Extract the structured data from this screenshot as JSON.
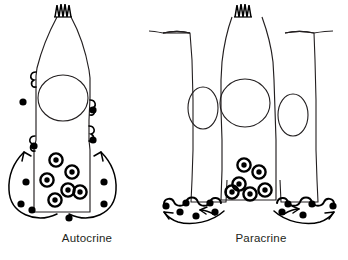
{
  "figure": {
    "background_color": "#ffffff",
    "ink_color": "#000000",
    "outline_color": "#231f20",
    "caption_color": "#231f20",
    "width": 348,
    "height": 260,
    "type": "line-art-diagram"
  },
  "panels": [
    {
      "id": "autocrine",
      "caption": "Autocrine",
      "cell_count": 1,
      "cell_shape": "flask",
      "apical_feature": "cilia-tuft",
      "cilia_peaks": 5,
      "nucleus_count": 1,
      "vesicle_count": 6,
      "receptor_count": 4,
      "ligand_dot_count": 11,
      "arrow_count": 2,
      "arrow_direction": "loops back to the same cell"
    },
    {
      "id": "paracrine",
      "caption": "Paracrine",
      "cell_count": 3,
      "cell_shape": "columnar epithelium with central flask cell",
      "apical_feature": "cilia-tuft",
      "cilia_peaks": 5,
      "nucleus_count": 3,
      "vesicle_count": 6,
      "receptor_count": 8,
      "ligand_dot_count": 14,
      "arrow_count": 4,
      "arrow_direction": "spreads outward to neighboring cells"
    }
  ],
  "legend": {
    "vesicle_label": "secretory vesicle",
    "ligand_label": "signal molecule",
    "receptor_label": "membrane receptor",
    "nucleus_label": "nucleus",
    "cilia_label": "cilia"
  }
}
